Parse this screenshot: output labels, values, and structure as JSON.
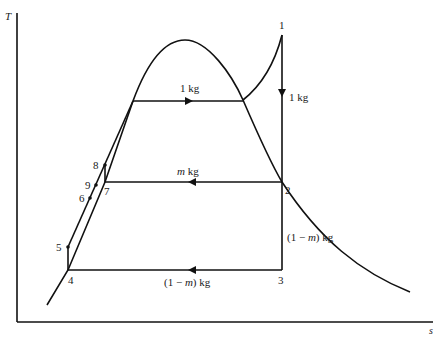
{
  "diagram": {
    "type": "T-s diagram (regenerative Rankine cycle with open feedwater heater)",
    "axes": {
      "y_label": "T",
      "x_label": "s"
    },
    "states": [
      {
        "id": "1",
        "label": "1"
      },
      {
        "id": "2",
        "label": "2"
      },
      {
        "id": "3",
        "label": "3"
      },
      {
        "id": "4",
        "label": "4"
      },
      {
        "id": "5",
        "label": "5"
      },
      {
        "id": "6",
        "label": "6"
      },
      {
        "id": "7",
        "label": "7"
      },
      {
        "id": "8",
        "label": "8"
      },
      {
        "id": "9",
        "label": "9"
      }
    ],
    "flow_labels": {
      "boiler": "1 kg",
      "turbine_1_2": "1 kg",
      "extraction": "m kg",
      "extraction_m": "m",
      "extraction_unit": " kg",
      "turbine_2_3_prefix": "(1 − ",
      "turbine_2_3_m": "m",
      "turbine_2_3_suffix": ") kg",
      "condenser_prefix": "(1 − ",
      "condenser_m": "m",
      "condenser_suffix": ") kg"
    },
    "line_color": "#111111"
  }
}
